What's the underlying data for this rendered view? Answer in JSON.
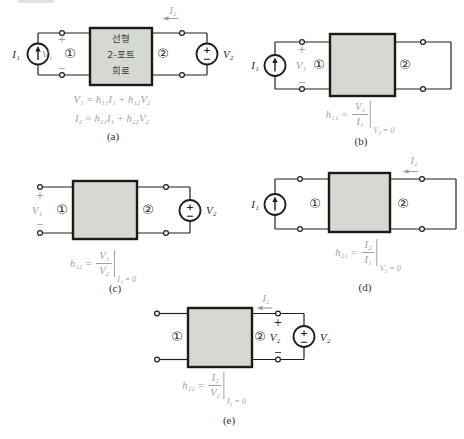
{
  "colors": {
    "wire": "#1f1f1f",
    "box_fill": "#d6d9d1",
    "gray_label": "#9ca2a2",
    "caption": "#333333"
  },
  "shared": {
    "i1": "I₁",
    "i2": "I₂",
    "v1": "V₁",
    "v2": "V₂",
    "plus": "+",
    "minus": "−",
    "port1": "①",
    "port2": "②"
  },
  "network_box": {
    "line1": "선형",
    "line2": "2-포트",
    "line3": "회로"
  },
  "figures": {
    "a": {
      "caption": "(a)",
      "eq1": "V₁ = h₁₁I₁ + h₁₂V₂",
      "eq2": "I₂ = h₂₁I₁ + h₂₂V₂"
    },
    "b": {
      "caption": "(b)",
      "eq": {
        "lhs": "h₁₁ =",
        "num": "V₁",
        "den": "I₁",
        "cond": "V₂ = 0"
      }
    },
    "c": {
      "caption": "(c)",
      "eq": {
        "lhs": "h₁₂ =",
        "num": "V₁",
        "den": "V₂",
        "cond": "I₁ = 0"
      }
    },
    "d": {
      "caption": "(d)",
      "eq": {
        "lhs": "h₂₁ =",
        "num": "I₂",
        "den": "I₁",
        "cond": "V₂ = 0"
      }
    },
    "e": {
      "caption": "(e)",
      "eq": {
        "lhs": "h₂₂ =",
        "num": "I₂",
        "den": "V₂",
        "cond": "I₁ = 0"
      }
    }
  }
}
